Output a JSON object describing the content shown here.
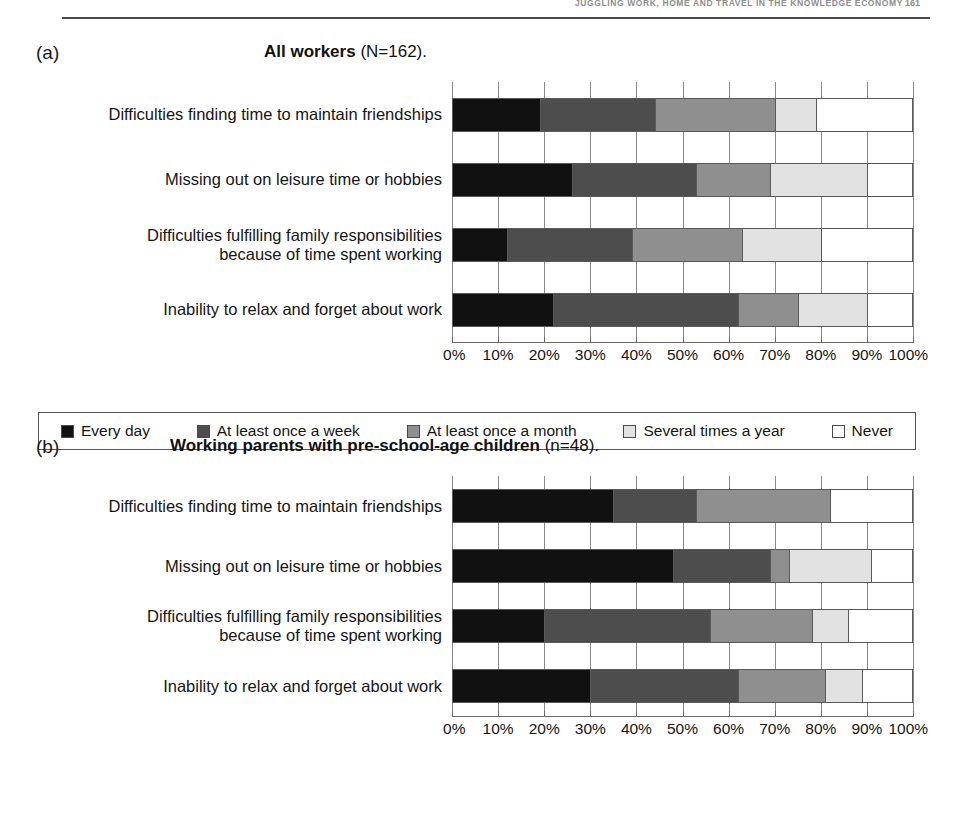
{
  "running_head": {
    "text": "Juggling work, home and travel in the knowledge economy",
    "page_number": "161"
  },
  "panels": [
    {
      "tag": "(a)",
      "title_strong": "All workers",
      "title_rest": " (N=162).",
      "row_height": 65,
      "categories": [
        "Difficulties finding time to maintain friendships",
        "Missing out on leisure time or hobbies",
        "Difficulties fulfilling family responsibilities\nbecause of time spent working",
        "Inability to relax and forget about work"
      ]
    },
    {
      "tag": "(b)",
      "title_strong": "Working parents with pre-school-age children",
      "title_rest": " (n=48).",
      "row_height": 60,
      "categories": [
        "Difficulties finding time to maintain friendships",
        "Missing out on leisure time or hobbies",
        "Difficulties fulfilling family responsibilities\nbecause of time spent working",
        "Inability to relax and forget about work"
      ]
    }
  ],
  "axis": {
    "ticks": [
      "0%",
      "10%",
      "20%",
      "30%",
      "40%",
      "50%",
      "60%",
      "70%",
      "80%",
      "90%",
      "100%"
    ],
    "min": 0,
    "max": 100
  },
  "legend": {
    "items": [
      {
        "label": "Every day",
        "color": "#111111"
      },
      {
        "label": "At least once a week",
        "color": "#4d4d4d"
      },
      {
        "label": "At least once a month",
        "color": "#8f8f8f"
      },
      {
        "label": "Several times a year",
        "color": "#e2e2e2"
      },
      {
        "label": "Never",
        "color": "#ffffff"
      }
    ]
  },
  "chart_data": [
    {
      "type": "bar",
      "orientation": "horizontal",
      "stacked": true,
      "percent": true,
      "title": "All workers (N=162).",
      "panel": "(a)",
      "xlabel": "",
      "ylabel": "",
      "xlim": [
        0,
        100
      ],
      "grid": true,
      "legend_position": "bottom",
      "categories": [
        "Difficulties finding time to maintain friendships",
        "Missing out on leisure time or hobbies",
        "Difficulties fulfilling family responsibilities because of time spent working",
        "Inability to relax and forget about work"
      ],
      "series": [
        {
          "name": "Every day",
          "values": [
            19,
            26,
            12,
            22
          ]
        },
        {
          "name": "At least once a week",
          "values": [
            25,
            27,
            27,
            40
          ]
        },
        {
          "name": "At least once a month",
          "values": [
            26,
            16,
            24,
            13
          ]
        },
        {
          "name": "Several times a year",
          "values": [
            9,
            21,
            17,
            15
          ]
        },
        {
          "name": "Never",
          "values": [
            21,
            10,
            20,
            10
          ]
        }
      ]
    },
    {
      "type": "bar",
      "orientation": "horizontal",
      "stacked": true,
      "percent": true,
      "title": "Working parents with pre-school-age children (n=48).",
      "panel": "(b)",
      "xlabel": "",
      "ylabel": "",
      "xlim": [
        0,
        100
      ],
      "grid": true,
      "legend_position": "bottom",
      "categories": [
        "Difficulties finding time to maintain friendships",
        "Missing out on leisure time or hobbies",
        "Difficulties fulfilling family responsibilities because of time spent working",
        "Inability to relax and forget about work"
      ],
      "series": [
        {
          "name": "Every day",
          "values": [
            35,
            48,
            20,
            30
          ]
        },
        {
          "name": "At least once a week",
          "values": [
            18,
            21,
            36,
            32
          ]
        },
        {
          "name": "At least once a month",
          "values": [
            29,
            4,
            22,
            19
          ]
        },
        {
          "name": "Several times a year",
          "values": [
            0,
            18,
            8,
            8
          ]
        },
        {
          "name": "Never",
          "values": [
            18,
            9,
            14,
            11
          ]
        }
      ]
    }
  ]
}
